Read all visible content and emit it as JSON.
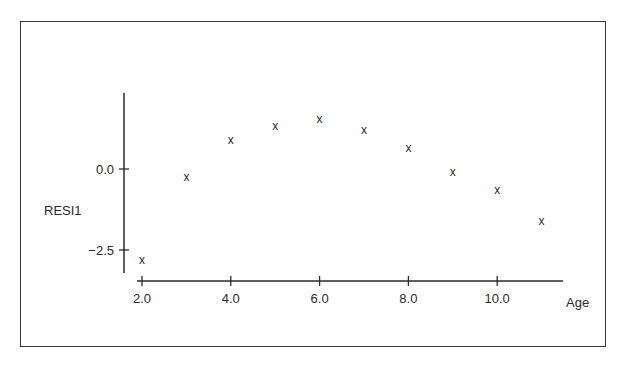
{
  "chart_data": {
    "type": "scatter",
    "title": "",
    "xlabel": "Age",
    "ylabel": "RESI1",
    "x": [
      2,
      3,
      4,
      5,
      6,
      7,
      8,
      9,
      10,
      11
    ],
    "series": [
      {
        "name": "RESI1",
        "marker": "x",
        "values": [
          -2.8,
          -0.25,
          0.9,
          1.33,
          1.55,
          1.2,
          0.65,
          -0.1,
          -0.65,
          -1.6
        ]
      }
    ],
    "x_ticks": [
      "2.0",
      "4.0",
      "6.0",
      "8.0",
      "10.0"
    ],
    "x_tick_values": [
      2,
      4,
      6,
      8,
      10
    ],
    "y_ticks": [
      "0.0",
      "-2.5"
    ],
    "y_tick_values": [
      0,
      -2.5
    ],
    "xlim": [
      1.9,
      11.5
    ],
    "ylim": [
      -3.2,
      2.35
    ],
    "grid": false,
    "legend": null
  },
  "labels": {
    "xlabel": "Age",
    "ylabel": "RESI1",
    "marker_glyph": "x"
  }
}
